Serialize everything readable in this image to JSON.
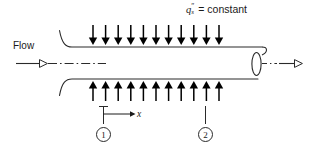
{
  "figure": {
    "name": "tube-flow-constant-surface-heat-flux",
    "width": 310,
    "height": 147,
    "background": "#ffffff",
    "line_color": "#2a2a2a",
    "arrow_color": "#000000"
  },
  "labels": {
    "flow": "Flow",
    "flux_symbol": "q",
    "flux_superscript": "″",
    "flux_subscript": "s",
    "flux_equals": "= constant",
    "axis_x": "x",
    "station_1": "1",
    "station_2": "2"
  },
  "geometry": {
    "tube": {
      "top_wall_y": 47,
      "bottom_wall_y": 79,
      "wall_start_x": 66,
      "wall_end_x": 262,
      "inlet_bell_top": {
        "x": 59,
        "y": 30
      },
      "inlet_bell_bottom": {
        "x": 59,
        "y": 96
      },
      "outlet_ellipse": {
        "cx": 256,
        "cy": 63,
        "rx": 5,
        "ry": 13
      }
    },
    "centerline": {
      "y": 63,
      "left_start_x": 27,
      "left_end_x": 106,
      "right_start_x": 262,
      "right_end_x": 276,
      "style": "dash-dot"
    },
    "inlet_arrow": {
      "x1": 16,
      "x2": 48,
      "y": 63,
      "head": "open-triangle"
    },
    "outlet_arrow": {
      "x1": 278,
      "x2": 303,
      "y": 63,
      "head": "open-triangle"
    }
  },
  "heat_flux_arrows": {
    "count": 11,
    "first_x": 93,
    "spacing": 12.6,
    "top": {
      "tail_y": 25,
      "tip_y": 45,
      "direction": "down"
    },
    "bottom": {
      "tail_y": 101,
      "tip_y": 81,
      "direction": "up"
    }
  },
  "stations": {
    "station_1": {
      "leader_x": 103,
      "leader_top_y": 106,
      "leader_bottom_y": 124,
      "tick_top_y": 106
    },
    "station_2": {
      "leader_x": 205,
      "leader_top_y": 106,
      "leader_bottom_y": 124
    },
    "x_axis_arrow": {
      "x1": 103,
      "x2": 133,
      "y": 114
    }
  }
}
